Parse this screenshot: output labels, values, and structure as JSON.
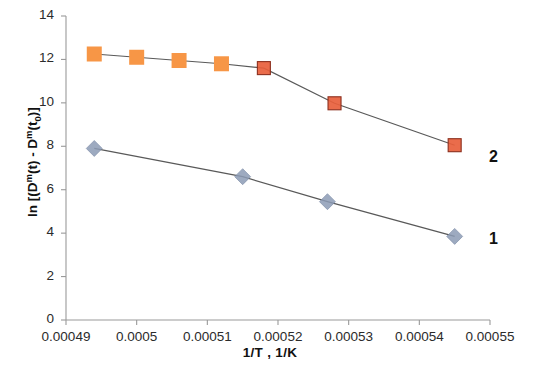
{
  "chart_data": {
    "type": "scatter",
    "title": "",
    "xlabel": "1/T , 1/K",
    "ylabel": "ln [(Dm(t) - Dm(t0)]",
    "ylabel_parts": {
      "prefix": "ln [(D",
      "sup1": "m",
      "mid1": "(t) - D",
      "sup2": "m",
      "mid2": "(t",
      "sub1": "0",
      "suffix": ")]"
    },
    "xlim": [
      0.00049,
      0.00055
    ],
    "ylim": [
      0,
      14
    ],
    "xticks": [
      "0.00049",
      "0.0005",
      "0.00051",
      "0.00052",
      "0.00053",
      "0.00054",
      "0.00055"
    ],
    "xtick_values": [
      0.00049,
      0.0005,
      0.00051,
      0.00052,
      0.00053,
      0.00054,
      0.00055
    ],
    "yticks": [
      "0",
      "2",
      "4",
      "6",
      "8",
      "10",
      "12",
      "14"
    ],
    "ytick_values": [
      0,
      2,
      4,
      6,
      8,
      10,
      12,
      14
    ],
    "grid": false,
    "legend_position": "right-inside-annotations",
    "series": [
      {
        "name": "2",
        "label": "2",
        "marker": "square",
        "color": "#F79646",
        "color_alt": "#E8603C",
        "line_color": "#595959",
        "x": [
          0.000494,
          0.0005,
          0.000506,
          0.000512,
          0.000518,
          0.000528,
          0.000545
        ],
        "y": [
          12.25,
          12.1,
          11.95,
          11.8,
          11.6,
          9.98,
          8.05
        ]
      },
      {
        "name": "1",
        "label": "1",
        "marker": "diamond",
        "color": "#8C9BB5",
        "line_color": "#595959",
        "x": [
          0.000494,
          0.000515,
          0.000527,
          0.000545
        ],
        "y": [
          7.9,
          6.6,
          5.45,
          3.85
        ]
      }
    ],
    "annotations": [
      {
        "text": "2",
        "x_px": 489,
        "y_px": 148
      },
      {
        "text": "1",
        "x_px": 489,
        "y_px": 230
      }
    ]
  },
  "colors": {
    "series2_marker": "#F79646",
    "series2_marker_dark": "#E8603C",
    "series1_marker": "#8C9BB5",
    "line": "#595959",
    "axis": "#9a9a9a",
    "text": "#222222",
    "background": "#FFFFFF"
  }
}
